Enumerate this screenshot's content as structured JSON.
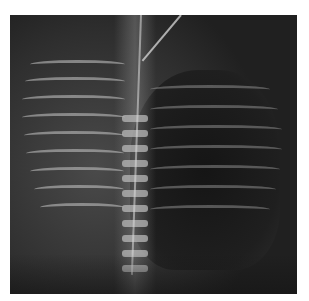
{
  "image": {
    "type": "radiograph",
    "subject": "chest X-ray (AP view)",
    "frame": {
      "left": 10,
      "top": 15,
      "width": 287,
      "height": 279
    },
    "colors": {
      "background": "#ffffff",
      "frame": "#2a2a2a",
      "bone": "#b8b8b8",
      "lung": "#151515"
    }
  }
}
